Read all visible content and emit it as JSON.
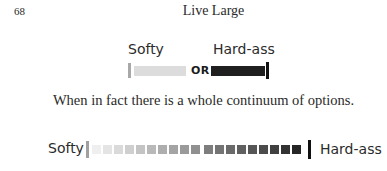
{
  "header": {
    "page_number": "68",
    "running_head": "Live Large"
  },
  "diagram_binary": {
    "left_label": "Softy",
    "right_label": "Hard-ass",
    "connector": "OR",
    "colors": {
      "left_marker": "#a8a8a8",
      "light_bar": "#dcdcdc",
      "dark_bar": "#1f1f1f",
      "right_marker": "#111111"
    }
  },
  "body": {
    "sentence": "When in fact there is a whole continuum of options."
  },
  "diagram_continuum": {
    "left_label": "Softy",
    "right_label": "Hard-ass",
    "light_group_colors": [
      "#efefef",
      "#e4e4e4",
      "#dadada",
      "#cfcfcf",
      "#c4c4c4",
      "#b9b9b9",
      "#aeaeae",
      "#a4a4a4",
      "#9a9a9a",
      "#909090"
    ],
    "dark_group_colors": [
      "#7e7e7e",
      "#747474",
      "#6a6a6a",
      "#606060",
      "#565656",
      "#4c4c4c",
      "#404040",
      "#333333",
      "#262626"
    ]
  }
}
